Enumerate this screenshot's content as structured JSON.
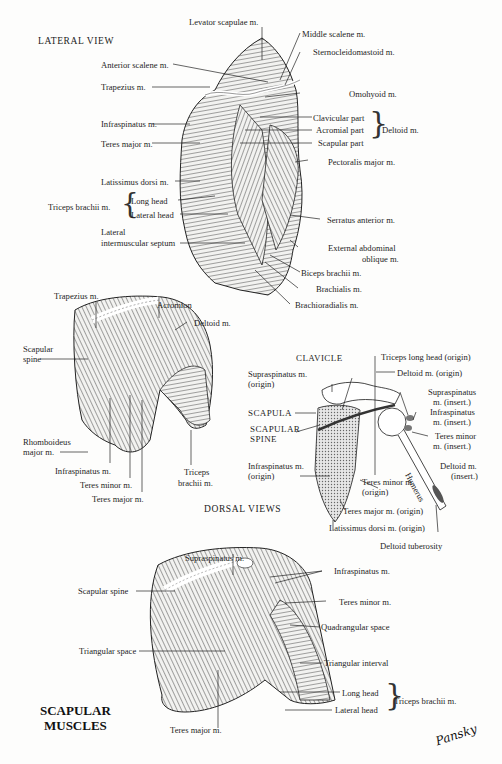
{
  "title": {
    "line1": "SCAPULAR",
    "line2": "MUSCLES"
  },
  "signature": "Pansky",
  "lateral_view": {
    "heading": "LATERAL VIEW",
    "labels": {
      "levator_scapulae": "Levator scapulae m.",
      "middle_scalene": "Middle scalene m.",
      "sternocleidomastoid": "Sternocleidomastoid m.",
      "anterior_scalene": "Anterior scalene m.",
      "trapezius": "Trapezius m.",
      "omohyoid": "Omohyoid m.",
      "infraspinatus": "Infraspinatus m.",
      "clavicular_part": "Clavicular part",
      "acromial_part": "Acromial part",
      "scapular_part": "Scapular part",
      "deltoid": "Deltoid m.",
      "teres_major": "Teres major m.",
      "pectoralis_major": "Pectoralis major m.",
      "latissimus_dorsi": "Latissimus dorsi m.",
      "triceps_brachii": "Triceps brachii m.",
      "long_head": "Long head",
      "lateral_head": "Lateral head",
      "lateral_septum_1": "Lateral",
      "lateral_septum_2": "intermuscular septum",
      "serratus_anterior": "Serratus anterior m.",
      "external_oblique_1": "External abdominal",
      "external_oblique_2": "oblique m.",
      "biceps_brachii": "Biceps brachii m.",
      "brachialis": "Brachialis m.",
      "brachioradialis": "Brachioradialis m."
    }
  },
  "dorsal_views": {
    "heading": "DORSAL VIEWS",
    "upper_left": {
      "trapezius": "Trapezius m.",
      "acromion": "Acromion",
      "deltoid": "Deltoid m.",
      "scapular_spine_1": "Scapular",
      "scapular_spine_2": "spine",
      "rhomboideus_1": "Rhomboideus",
      "rhomboideus_2": "major m.",
      "infraspinatus": "Infraspinatus m.",
      "teres_minor": "Teres minor m.",
      "teres_major": "Teres major m.",
      "triceps_1": "Triceps",
      "triceps_2": "brachii m."
    },
    "bone_diagram": {
      "clavicle": "CLAVICLE",
      "triceps_long_head_origin": "Triceps long head (origin)",
      "supraspinatus_origin_1": "Supraspinatus m.",
      "supraspinatus_origin_2": "(origin)",
      "deltoid_origin": "Deltoid m. (origin)",
      "supraspinatus_insert_1": "Supraspinatus",
      "supraspinatus_insert_2": "m. (insert.)",
      "scapula": "SCAPULA",
      "infraspinatus_insert_1": "Infraspinatus",
      "infraspinatus_insert_2": "m. (insert.)",
      "scapular_spine_1": "SCAPULAR",
      "scapular_spine_2": "SPINE",
      "teres_minor_insert_1": "Teres minor",
      "teres_minor_insert_2": "m. (insert.)",
      "infraspinatus_origin_1": "Infraspinatus m.",
      "infraspinatus_origin_2": "(origin)",
      "humerus": "Humerus",
      "deltoid_insert_1": "Deltoid m.",
      "deltoid_insert_2": "(insert.)",
      "teres_minor_origin_1": "Teres minor m.",
      "teres_minor_origin_2": "(origin)",
      "teres_major_origin": "Teres major m. (origin)",
      "latissimus_origin": "Latissimus dorsi m. (origin)",
      "deltoid_tuberosity": "Deltoid tuberosity"
    },
    "lower": {
      "supraspinatus": "Supraspinatus m.",
      "scapular_spine": "Scapular spine",
      "infraspinatus": "Infraspinatus m.",
      "teres_minor": "Teres minor m.",
      "quadrangular_space": "Quadrangular space",
      "triangular_space": "Triangular space",
      "triangular_interval": "Triangular interval",
      "long_head": "Long head",
      "lateral_head": "Lateral head",
      "triceps_brachii": "Triceps brachii m.",
      "teres_major": "Teres major m."
    }
  }
}
